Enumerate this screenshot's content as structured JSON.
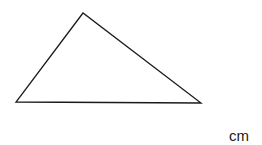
{
  "diagram": {
    "shape": "triangle",
    "vertices": [
      {
        "name": "apex",
        "x": 83,
        "y": 13
      },
      {
        "name": "bottom-left",
        "x": 16,
        "y": 102
      },
      {
        "name": "bottom-right",
        "x": 201,
        "y": 103
      }
    ],
    "stroke_color": "#1a1a1a",
    "stroke_width": 1.3,
    "unit_label": "cm"
  }
}
